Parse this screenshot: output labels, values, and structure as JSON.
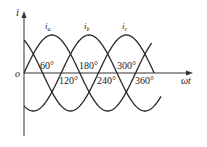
{
  "chart_data": {
    "type": "line",
    "title": "",
    "xlabel": "ωt",
    "ylabel": "i",
    "origin_label": "o",
    "grid": false,
    "legend": "inline labels above peaks",
    "x_unit": "degrees",
    "tick_labels_above": [
      "60°",
      "180°",
      "300°"
    ],
    "tick_labels_below": [
      "120°",
      "240°",
      "360°"
    ],
    "tick_values": [
      60,
      120,
      180,
      240,
      300,
      360
    ],
    "x_range_deg": [
      0,
      440
    ],
    "y_range": [
      -1,
      1
    ],
    "series": [
      {
        "name": "i_a",
        "label_main": "i",
        "label_sub": "a",
        "function": "sin(ωt)",
        "phase_deg": 0,
        "amplitude": 1
      },
      {
        "name": "i_b",
        "label_main": "i",
        "label_sub": "b",
        "function": "sin(ωt - 120°)",
        "phase_deg": -120,
        "amplitude": 1
      },
      {
        "name": "i_c",
        "label_main": "i",
        "label_sub": "c",
        "function": "sin(ωt + 120°)",
        "phase_deg": 120,
        "amplitude": 1
      }
    ],
    "line_color": "#2a2a2a"
  },
  "geometry": {
    "origin_x": 24,
    "origin_y": 73,
    "amplitude_px": 38,
    "px_per_deg": 0.31,
    "x_axis_end": 192,
    "y_axis_top": 12,
    "y_axis_bottom": 136
  },
  "labels": {
    "axis_y": "i",
    "axis_x": "ωt",
    "origin": "o",
    "t60": "60°",
    "t120": "120°",
    "t180": "180°",
    "t240": "240°",
    "t300": "300°",
    "t360": "360°",
    "ia_main": "i",
    "ia_sub": "a",
    "ib_main": "i",
    "ib_sub": "b",
    "ic_main": "i",
    "ic_sub": "c"
  }
}
